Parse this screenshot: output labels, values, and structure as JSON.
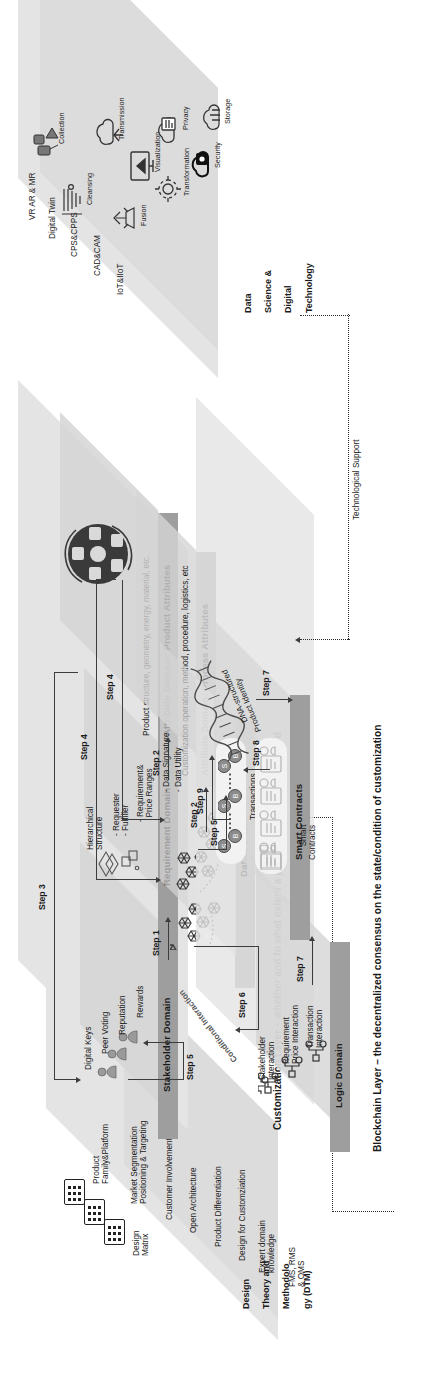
{
  "figure": {
    "orientation": "landscape-rotated-90ccw"
  },
  "palette": {
    "slab": "#d8d8d8",
    "band": "#bdbdbd",
    "band_dark": "#9e9e9e",
    "plate": "#d5d5d5",
    "ink": "#1a1a1a",
    "connector": "#3c3c3c"
  },
  "tech_layer": {
    "name": "Data Science & Digital Technology",
    "title_lines": [
      "Data",
      "Science &",
      "Digital",
      "Technology"
    ],
    "enablers": [
      "VR AR & MR",
      "Digital Twin",
      "CPS&CPPS",
      "CAD&CAM",
      "IoT&IIoT"
    ],
    "capabilities": [
      {
        "label": "Collection",
        "icon": "satellite-collection-icon"
      },
      {
        "label": "Cleansing",
        "icon": "funnel-cleansing-icon"
      },
      {
        "label": "Transmission",
        "icon": "cloud-transmission-icon"
      },
      {
        "label": "Visualization",
        "icon": "monitor-visualization-icon"
      },
      {
        "label": "Fusion",
        "icon": "gear-fusion-icon"
      },
      {
        "label": "Transformation",
        "icon": "gear-transformation-icon"
      },
      {
        "label": "Privacy",
        "icon": "cloud-privacy-icon"
      },
      {
        "label": "Security",
        "icon": "cloud-lock-security-icon"
      },
      {
        "label": "Storage",
        "icon": "cloud-storage-icon"
      }
    ]
  },
  "dtm_layer": {
    "title_lines": [
      "Design",
      "Theory and",
      "Methodolo",
      "gy (DTM)"
    ],
    "subgroup_label_lines": [
      "Design",
      "Matrix"
    ],
    "items": [
      "Product\nFamily&Platform",
      "Market Segmentation\nPositioning & Targeting",
      "Customer Involvement",
      "Open Architecture",
      "Product Differentiation",
      "Design for Customziation",
      "Expert domain\nknowledge",
      "FMS, RMS\n& OMS"
    ],
    "icons": [
      "matrix-grid-icon",
      "matrix-grid-icon",
      "matrix-grid-icon"
    ]
  },
  "customization_layer": {
    "caption": "Customization Layer – whether and to what extent a product has been customized",
    "domains": [
      {
        "id": "stakeholder",
        "label": "Stakeholder Domain",
        "attributes": [
          "Digital Keys",
          "Peer Voting",
          "Reputation",
          "Rewards"
        ],
        "icon": "stakeholder-people-icon"
      },
      {
        "id": "requirement",
        "label": "Requirement Domain",
        "attributes": [
          "Hierarchical\nStructure",
          "- Requester\n- Fulfiller",
          "- Requirement&\n  Price Ranges"
        ],
        "icon": "hierarchy-blocks-icon"
      },
      {
        "id": "attribute-product",
        "label": "Attribute Domain: Product Attributes",
        "caption": "Product structure, geometry, energy, material, etc.",
        "icon": "product-attribute-wheel-icon"
      },
      {
        "id": "attribute-process",
        "label": "Attribute Domain: Process Attributes",
        "caption": "Customization operation, method, procedure, logistics, etc",
        "icon": "process-attribute-icon"
      },
      {
        "id": "data",
        "label": "Data Domain",
        "attributes": [
          "- Data Signature",
          "- Data Utility"
        ],
        "icon": "hexagon-data-network-icon"
      }
    ]
  },
  "blockchain_layer": {
    "caption": "Blockchain Layer – the decentralized consensus on the state/condition of customization",
    "domains": [
      {
        "id": "logic",
        "label": "Logic Domain",
        "attributes": [
          "Stakeholder\nInteraction",
          "Requirement\nPrice Interaction",
          "Transaction\nInteraction"
        ],
        "ribbon": "Conditional Interaction",
        "icon": "node-interaction-icon"
      },
      {
        "id": "smart-contracts",
        "label": "Smart Contracts",
        "groups": [
          {
            "label": "Transactions",
            "icon": "transaction-chain-icon",
            "nodes": [
              "S",
              "B",
              "S",
              "B",
              "S",
              "B"
            ]
          },
          {
            "label": "Smart\nContracts",
            "icon": "contract-document-icon"
          }
        ]
      }
    ],
    "artifact": {
      "label": "DNA-structured\nProduct Identity",
      "icon": "dna-helix-icon"
    }
  },
  "steps": [
    {
      "id": "step1",
      "label": "Step 1"
    },
    {
      "id": "step2a",
      "label": "Step 2"
    },
    {
      "id": "step2b",
      "label": "Step 2"
    },
    {
      "id": "step3",
      "label": "Step 3"
    },
    {
      "id": "step4a",
      "label": "Step 4"
    },
    {
      "id": "step4b",
      "label": "Step 4"
    },
    {
      "id": "step5a",
      "label": "Step 5"
    },
    {
      "id": "step5b",
      "label": "Step 5"
    },
    {
      "id": "step6",
      "label": "Step 6"
    },
    {
      "id": "step7a",
      "label": "Step 7"
    },
    {
      "id": "step7b",
      "label": "Step 7"
    },
    {
      "id": "step8",
      "label": "Step 8"
    },
    {
      "id": "step9",
      "label": "Step 9"
    }
  ],
  "support": {
    "technological": "Technological Support",
    "methodological": "Methodological Support"
  }
}
